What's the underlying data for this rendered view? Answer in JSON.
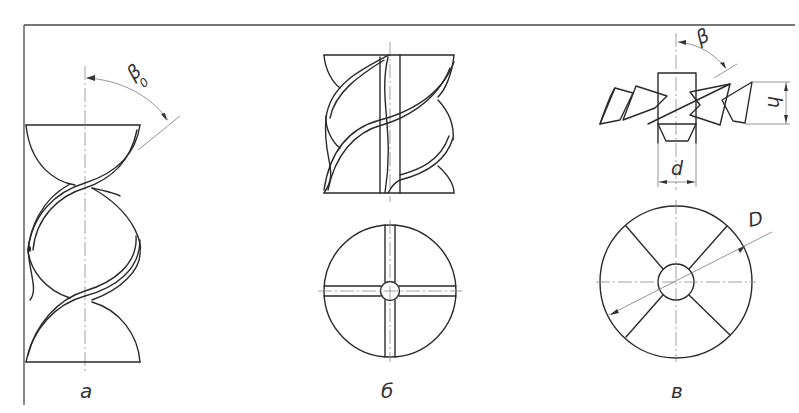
{
  "figure": {
    "panels": [
      {
        "id": "a",
        "label": "а",
        "description": "two-blade helical (twisted) mixer, side view",
        "angle_symbol": "β",
        "angle_subscript": "0"
      },
      {
        "id": "b",
        "label": "б",
        "description": "four-blade helical rotor, side view and top view"
      },
      {
        "id": "v",
        "label": "в",
        "description": "inclined-blade impeller with hub, side view and top view",
        "angle_symbol": "β",
        "dimension_h": "h",
        "dimension_d": "d",
        "dimension_D": "D"
      }
    ]
  },
  "colors": {
    "line": "#2a2a2a",
    "thin_line": "#7a7a7a",
    "background": "#ffffff"
  }
}
